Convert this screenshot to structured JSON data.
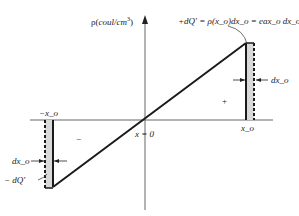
{
  "diagram": {
    "y_axis_label": "ρ(coul/cm³)",
    "y_axis_label_parts": {
      "rho": "ρ(",
      "unit": "coul/cm",
      "exp": "3",
      "close": ")"
    },
    "origin_label": "x = 0",
    "right_position_label": "x_o",
    "left_position_label": "−x_o",
    "right_charge_equation": "+dQ′ = ρ(x_o)dx_o = eax_o dx_o",
    "right_width_label": "dx_o",
    "left_width_label": "dx_o",
    "left_charge_label": "− dQ′",
    "positive_region_sign": "+",
    "negative_region_sign": "−",
    "colors": {
      "line": "#1a1a1a",
      "axis": "#555555",
      "strip_fill": "#d9d9d9"
    }
  }
}
